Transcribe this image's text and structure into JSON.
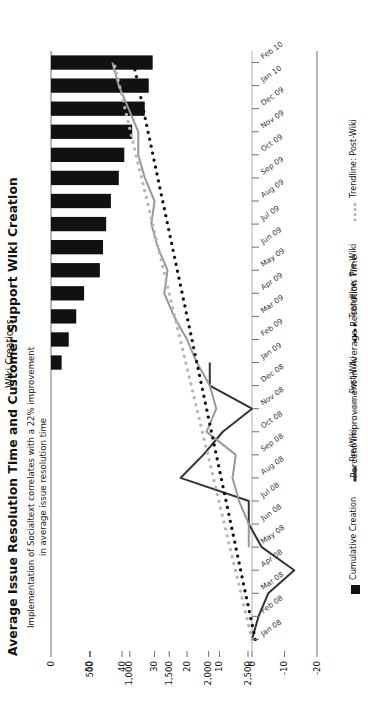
{
  "title": "Average Issue Resolution Time and Customer Support Wiki Creation",
  "subtitle_line1": "Implementation of Socialtext correlates with a 22% improvement",
  "subtitle_line2": "in average issue resolution time",
  "legend": {
    "items": [
      {
        "label": "Cumulative Creation",
        "marker": "square-swatch",
        "color": "#111111"
      },
      {
        "label": "Pre-Wiki",
        "marker": "solid-line-swatch",
        "color": "#333333"
      },
      {
        "label": "Post-Wiki",
        "marker": "solid-line-swatch",
        "color": "#999999"
      },
      {
        "label": "Trendline: Pre-Wiki",
        "marker": "dotted-line-swatch",
        "color": "#111111"
      },
      {
        "label": "Trendline: Post-Wiki",
        "marker": "dotted-line-swatch",
        "color": "#b5b5b5"
      }
    ]
  },
  "chart_data": {
    "type": "bar",
    "title": "Average Issue Resolution Time and Customer Support Wiki Creation",
    "subtitle": "Implementation of Socialtext correlates with a 22% improvement in average issue resolution time",
    "xlabel": "",
    "ylabel": "",
    "grid": false,
    "legend_position": "bottom",
    "orientation": "rotated-90-counterclockwise",
    "categories": [
      "Jan 08",
      "Feb 08",
      "Mar 08",
      "Apr 08",
      "May 08",
      "Jun 08",
      "Jul 08",
      "Aug 08",
      "Sep 08",
      "Oct 08",
      "Nov 08",
      "Dec 08",
      "Jan 09",
      "Feb 09",
      "Mar 09",
      "Apr 09",
      "May 09",
      "Jun 09",
      "Jul 09",
      "Aug 09",
      "Sep 09",
      "Oct 09",
      "Nov 09",
      "Dec 09",
      "Jan 10",
      "Feb 10"
    ],
    "axes": {
      "wiki_creations": {
        "label": "Wiki Creations",
        "ticks": [
          0,
          500,
          1000,
          1500,
          2000,
          2500
        ],
        "ticklabels": [
          "0",
          "500",
          "1,000",
          "1,500",
          "2,000",
          "2,500"
        ],
        "lim": [
          0,
          2700
        ],
        "position": "top"
      },
      "percent_improvement": {
        "label": "Percent Improvement in Average Resolution Time",
        "ticks": [
          50,
          40,
          30,
          20,
          10,
          0,
          -10,
          -20
        ],
        "ticklabels": [
          "50",
          "40",
          "30",
          "20",
          "10",
          "0",
          "-10",
          "-20"
        ],
        "lim": [
          -20,
          50
        ],
        "position": "bottom"
      }
    },
    "series": [
      {
        "name": "Cumulative Creation",
        "type": "bar",
        "axis": "wiki_creations",
        "color": "#111111",
        "values": [
          0,
          0,
          0,
          0,
          0,
          0,
          0,
          0,
          0,
          0,
          0,
          0,
          135,
          225,
          320,
          420,
          620,
          660,
          700,
          760,
          860,
          930,
          1030,
          1190,
          1240,
          1290
        ]
      },
      {
        "name": "Pre-Wiki",
        "type": "line",
        "axis": "percent_improvement",
        "color": "#333333",
        "values": [
          0,
          -2,
          -5,
          -13,
          -3,
          1,
          1,
          22,
          15,
          9,
          0,
          13,
          13,
          null,
          null,
          null,
          null,
          null,
          null,
          null,
          null,
          null,
          null,
          null,
          null,
          null
        ]
      },
      {
        "name": "Post-Wiki",
        "type": "line",
        "axis": "percent_improvement",
        "color": "#999999",
        "values": [
          null,
          null,
          null,
          null,
          1,
          1,
          4,
          6,
          5,
          14,
          11,
          13,
          17,
          20,
          24,
          27,
          26,
          29,
          31,
          30,
          33,
          35,
          35,
          38,
          41,
          43
        ]
      },
      {
        "name": "Trendline: Pre-Wiki",
        "type": "line",
        "style": "dotted",
        "axis": "percent_improvement",
        "color": "#111111",
        "values": [
          -1,
          0.5,
          2,
          3.5,
          5,
          6.5,
          8,
          9.5,
          11,
          12.5,
          14,
          15.5,
          17,
          18.5,
          20,
          21.5,
          23,
          24.5,
          26,
          27.5,
          29,
          30.5,
          32,
          33.5,
          35,
          36.5
        ]
      },
      {
        "name": "Trendline: Post-Wiki",
        "type": "line",
        "style": "dotted",
        "axis": "percent_improvement",
        "color": "#b5b5b5",
        "values": [
          0,
          1.7,
          3.4,
          5.1,
          6.8,
          8.5,
          10.2,
          11.9,
          13.6,
          15.3,
          17,
          18.7,
          20.4,
          22.1,
          23.8,
          25.5,
          27.2,
          28.9,
          30.6,
          32.3,
          34,
          35.7,
          37.4,
          39.1,
          40.8,
          42.5
        ]
      }
    ]
  }
}
